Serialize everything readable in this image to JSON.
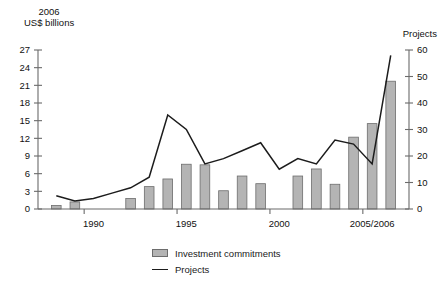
{
  "chart_data": {
    "type": "bar",
    "title": "",
    "subtitle": "",
    "left_axis_title": "2006\nUS$ billions",
    "right_axis_title": "Projects",
    "xlabel": "",
    "ylabel": "2006 US$ billions",
    "y2label": "Projects",
    "ylim": [
      0,
      27
    ],
    "y2lim": [
      0,
      60
    ],
    "yticks": [
      0,
      3,
      6,
      9,
      12,
      15,
      18,
      21,
      24,
      27
    ],
    "y2ticks": [
      0,
      10,
      20,
      30,
      40,
      50,
      60
    ],
    "grid": false,
    "legend_position": "bottom",
    "categories": [
      1988,
      1989,
      1990,
      1991,
      1992,
      1993,
      1994,
      1995,
      1996,
      1997,
      1998,
      1999,
      2000,
      2001,
      2002,
      2003,
      2004,
      2005,
      2006
    ],
    "x_tick_labels": [
      "1990",
      "1995",
      "2000",
      "2005/2006"
    ],
    "x_tick_categories": [
      1990,
      1995,
      2000,
      2005
    ],
    "series": [
      {
        "name": "Investment commitments",
        "type": "bar",
        "axis": "left",
        "unit": "2006 US$ billions",
        "values": [
          0.6,
          1.2,
          0.0,
          0.0,
          1.8,
          3.8,
          5.1,
          7.6,
          7.5,
          3.1,
          5.6,
          4.3,
          0.0,
          5.6,
          6.8,
          4.2,
          12.2,
          14.5,
          21.7
        ]
      },
      {
        "name": "Projects",
        "type": "line",
        "axis": "right",
        "unit": "number of projects",
        "values": [
          5,
          3,
          4,
          6,
          8,
          12,
          35.5,
          30,
          17,
          19,
          22,
          25,
          15,
          19,
          17,
          26,
          24.5,
          17,
          58
        ]
      }
    ]
  },
  "legend": {
    "items": [
      {
        "label": "Investment commitments",
        "marker": "bar-swatch",
        "color": "#b4b4b4"
      },
      {
        "label": "Projects",
        "marker": "line-swatch",
        "color": "#1c1c1c"
      }
    ]
  }
}
